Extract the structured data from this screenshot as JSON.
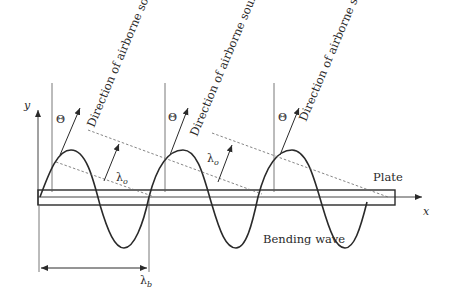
{
  "figure": {
    "labels": {
      "direction": [
        "Direction of airborne sound",
        "Direction of airborne sound",
        "Direction of airborne sound"
      ],
      "theta": [
        "Θ",
        "Θ",
        "Θ"
      ],
      "lambda_o": [
        "λ",
        "λ"
      ],
      "lambda_o_sub": "o",
      "lambda_b": "λ",
      "lambda_b_sub": "b",
      "plate": "Plate",
      "bending_wave": "Bending wave",
      "x_axis": "x",
      "y_axis": "y"
    },
    "colors": {
      "stroke": "#2a2a2a",
      "thin": "#555555",
      "background": "#ffffff"
    }
  }
}
